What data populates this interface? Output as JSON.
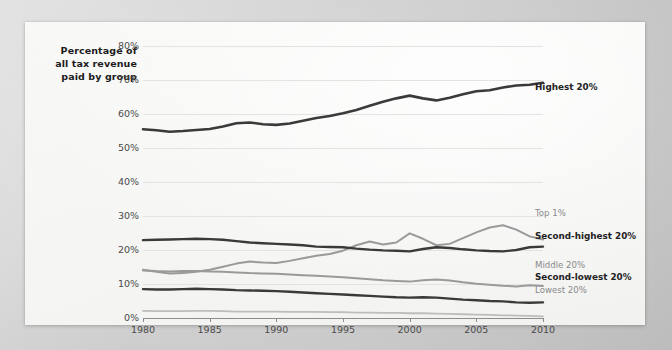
{
  "axis_caption": "Percentage of all tax revenue paid by group",
  "chart_data": {
    "type": "line",
    "title": "",
    "subtitle": "",
    "xlabel": "",
    "ylabel": "Percentage of all tax revenue paid by group",
    "xlim": [
      1980,
      2010
    ],
    "ylim": [
      0,
      80
    ],
    "grid": true,
    "legend_position": "inline-right",
    "y_ticks": [
      "0%",
      "10%",
      "20%",
      "30%",
      "40%",
      "50%",
      "60%",
      "70%",
      "80%"
    ],
    "y_tick_values": [
      0,
      10,
      20,
      30,
      40,
      50,
      60,
      70,
      80
    ],
    "x_ticks": [
      "1980",
      "1985",
      "1990",
      "1995",
      "2000",
      "2005",
      "2010"
    ],
    "x_tick_values": [
      1980,
      1985,
      1990,
      1995,
      2000,
      2005,
      2010
    ],
    "x": [
      1980,
      1981,
      1982,
      1983,
      1984,
      1985,
      1986,
      1987,
      1988,
      1989,
      1990,
      1991,
      1992,
      1993,
      1994,
      1995,
      1996,
      1997,
      1998,
      1999,
      2000,
      2001,
      2002,
      2003,
      2004,
      2005,
      2006,
      2007,
      2008,
      2009,
      2010
    ],
    "series": [
      {
        "name": "Highest 20%",
        "label": "Highest 20%",
        "color": "#3a3a3a",
        "emphasis": "bold",
        "width": 2.6,
        "values": [
          55.5,
          55.2,
          54.8,
          55.0,
          55.3,
          55.6,
          56.3,
          57.3,
          57.5,
          57.0,
          56.8,
          57.2,
          58.0,
          58.8,
          59.4,
          60.2,
          61.2,
          62.4,
          63.6,
          64.6,
          65.4,
          64.6,
          64.0,
          64.8,
          65.8,
          66.7,
          67.0,
          67.8,
          68.4,
          68.6,
          69.2
        ]
      },
      {
        "name": "Top 1%",
        "label": "Top 1%",
        "color": "#9a9a9a",
        "emphasis": "normal",
        "width": 2.0,
        "values": [
          14.2,
          13.6,
          13.1,
          13.2,
          13.6,
          14.2,
          15.1,
          16.0,
          16.6,
          16.3,
          16.2,
          16.8,
          17.6,
          18.3,
          18.8,
          19.8,
          21.4,
          22.5,
          21.6,
          22.2,
          24.9,
          23.3,
          21.4,
          21.8,
          23.5,
          25.2,
          26.6,
          27.3,
          26.0,
          24.0,
          23.1
        ]
      },
      {
        "name": "Second-highest 20%",
        "label": "Second-highest 20%",
        "color": "#3a3a3a",
        "emphasis": "bold",
        "width": 2.4,
        "values": [
          22.9,
          23.0,
          23.1,
          23.2,
          23.3,
          23.2,
          23.0,
          22.6,
          22.2,
          22.0,
          21.8,
          21.6,
          21.4,
          21.0,
          20.9,
          20.8,
          20.4,
          20.1,
          19.9,
          19.8,
          19.6,
          20.3,
          20.8,
          20.6,
          20.2,
          19.9,
          19.7,
          19.6,
          20.0,
          20.8,
          21.0
        ]
      },
      {
        "name": "Middle 20%",
        "label": "Middle 20%",
        "color": "#9a9a9a",
        "emphasis": "normal",
        "width": 2.0,
        "values": [
          14.0,
          13.8,
          13.7,
          13.8,
          13.8,
          13.7,
          13.6,
          13.4,
          13.2,
          13.1,
          13.0,
          12.8,
          12.6,
          12.4,
          12.2,
          12.0,
          11.7,
          11.4,
          11.1,
          10.9,
          10.7,
          11.1,
          11.3,
          11.0,
          10.5,
          10.1,
          9.8,
          9.5,
          9.3,
          9.6,
          9.4
        ]
      },
      {
        "name": "Second-lowest 20%",
        "label": "Second-lowest 20%",
        "color": "#3a3a3a",
        "emphasis": "bold",
        "width": 2.4,
        "values": [
          8.5,
          8.4,
          8.4,
          8.5,
          8.6,
          8.5,
          8.4,
          8.2,
          8.1,
          8.0,
          7.9,
          7.7,
          7.5,
          7.3,
          7.1,
          6.9,
          6.7,
          6.5,
          6.3,
          6.1,
          6.0,
          6.1,
          6.0,
          5.7,
          5.4,
          5.2,
          5.0,
          4.9,
          4.6,
          4.5,
          4.6
        ]
      },
      {
        "name": "Lowest 20%",
        "label": "Lowest 20%",
        "color": "#bdbdbd",
        "emphasis": "normal",
        "width": 1.8,
        "values": [
          2.1,
          2.0,
          2.0,
          2.0,
          2.1,
          2.1,
          2.0,
          1.9,
          1.9,
          1.9,
          1.9,
          1.8,
          1.8,
          1.8,
          1.7,
          1.7,
          1.6,
          1.6,
          1.5,
          1.5,
          1.4,
          1.4,
          1.3,
          1.2,
          1.1,
          1.0,
          0.9,
          0.8,
          0.7,
          0.6,
          0.5
        ]
      }
    ]
  },
  "series_labels": [
    {
      "text": "Highest 20%",
      "style": "dark",
      "top": 82,
      "left": 535
    },
    {
      "text": "Top 1%",
      "style": "gray",
      "top": 208,
      "left": 535
    },
    {
      "text": "Second-highest 20%",
      "style": "dark",
      "top": 231,
      "left": 535
    },
    {
      "text": "Middle 20%",
      "style": "gray",
      "top": 260,
      "left": 535
    },
    {
      "text": "Second-lowest 20%",
      "style": "dark",
      "top": 272,
      "left": 535
    },
    {
      "text": "Lowest 20%",
      "style": "gray",
      "top": 285,
      "left": 535
    }
  ],
  "colors": {
    "dark_line": "#3a3a3a",
    "gray_line": "#9a9a9a",
    "light_line": "#bdbdbd",
    "gridline": "#e3e3e1",
    "axis": "#8d8d8d",
    "page": "#f8f8f7",
    "surround": "#d3d3d3"
  }
}
